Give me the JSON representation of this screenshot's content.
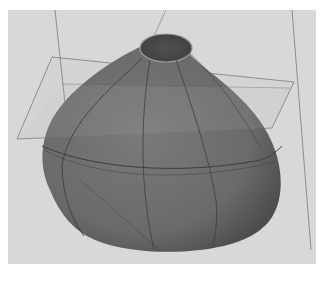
{
  "figure": {
    "colors": {
      "page_background": "#ffffff",
      "viewport_background": "#d8d8d8",
      "body_fill": "#6e6e6e",
      "body_shadow": "#4f4f4f",
      "opening_fill": "#4a4a4a",
      "plane_stroke": "#7a7a7a",
      "curve_stroke": "#3e3e3e"
    }
  }
}
